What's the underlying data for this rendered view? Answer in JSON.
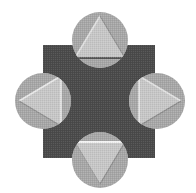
{
  "figure": {
    "title": "Four-lobed rosette emblem",
    "width": 196,
    "height": 193,
    "background_color": "#ffffff"
  },
  "palette": {
    "background": "#ffffff",
    "square_fill": "#b4b4b4",
    "center_fill": "#4a4a4a",
    "circle_fill": "#a6a6a6",
    "triangle_fill": "#c6c6c6",
    "triangle_highlight": "#e0e0e0",
    "triangle_shadow": "#8e8e8e",
    "edge_line": "#f0f0f0"
  },
  "square": {
    "label": "Background square",
    "x": 43,
    "y": 45,
    "width": 112,
    "height": 113,
    "fill": "#b4b4b4"
  },
  "center_shape": {
    "label": "Concave four-pointed center",
    "description": "Square minus four circles (astroid-like)",
    "fill": "#4a4a4a"
  },
  "lobes": [
    {
      "id": "north",
      "label": "Top circle with upward triangle",
      "circle_name": "circle-north",
      "triangle_name": "triangle-north",
      "direction": "up",
      "cx": 100,
      "cy": 40,
      "r": 28,
      "triangle_points": "100,16 125,58 75,58",
      "highlight_points": "100,16 75,58",
      "baseline_points": "75,58 125,58"
    },
    {
      "id": "west",
      "label": "Left circle with leftward triangle",
      "circle_name": "circle-west",
      "triangle_name": "triangle-west",
      "direction": "left",
      "cx": 43,
      "cy": 101,
      "r": 28,
      "triangle_points": "19,101 61,76 61,126",
      "highlight_points": "19,101 61,76",
      "baseline_points": "61,76 61,126"
    },
    {
      "id": "east",
      "label": "Right circle with rightward triangle",
      "circle_name": "circle-east",
      "triangle_name": "triangle-east",
      "direction": "right",
      "cx": 157,
      "cy": 101,
      "r": 28,
      "triangle_points": "181,101 139,76 139,126",
      "highlight_points": "139,76 181,101",
      "baseline_points": "139,76 139,126"
    },
    {
      "id": "south",
      "label": "Bottom circle with downward triangle",
      "circle_name": "circle-south",
      "triangle_name": "triangle-south",
      "direction": "down",
      "cx": 100,
      "cy": 160,
      "r": 28,
      "triangle_points": "100,184 75,142 125,142",
      "highlight_points": "75,142 125,142",
      "baseline_points": "75,142 125,142"
    }
  ]
}
